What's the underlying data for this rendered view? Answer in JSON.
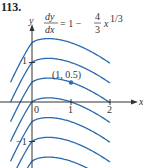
{
  "problem_number": "113.",
  "chart_data": {
    "type": "line",
    "equation": {
      "numerator": "dy",
      "denominator": "dx",
      "rhs_prefix": "= 1 −",
      "frac_num": "4",
      "frac_den": "3",
      "rhs_var": "x",
      "exponent": "1/3"
    },
    "xlabel": "x",
    "ylabel": "y",
    "x_ticks": [
      "0",
      "1",
      "2"
    ],
    "y_ticks": [
      "1",
      "−1"
    ],
    "xlim": [
      -0.8,
      2.6
    ],
    "ylim": [
      -1.7,
      2.5
    ],
    "grid": false,
    "series_description": "Family of solution curves y = x − x^(4/3) + C",
    "series": [
      {
        "name": "C = 1.5",
        "C": 1.5
      },
      {
        "name": "C = 1",
        "C": 1
      },
      {
        "name": "C = 0.5",
        "C": 0.5
      },
      {
        "name": "C = 0",
        "C": 0
      },
      {
        "name": "C = -0.5",
        "C": -0.5
      },
      {
        "name": "C = -1",
        "C": -1
      },
      {
        "name": "C = -1.5",
        "C": -1.5
      }
    ],
    "annotations": [
      {
        "label": "(1, 0.5)",
        "x": 1,
        "y": 0.5
      }
    ],
    "curve_color": "#2b6cb0",
    "point_color": "#2b6cb0"
  }
}
